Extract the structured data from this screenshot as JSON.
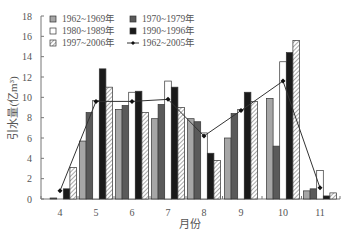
{
  "chart_data": {
    "type": "bar",
    "title": "",
    "xlabel": "月份",
    "ylabel": "引水量(亿m³)",
    "ylim": [
      0,
      18
    ],
    "yticks": [
      0,
      2,
      4,
      6,
      8,
      10,
      12,
      14,
      16,
      18
    ],
    "grid": false,
    "legend_position": "upper-left, inside, 2 columns",
    "categories": [
      "4",
      "5",
      "6",
      "7",
      "8",
      "9",
      "10",
      "11"
    ],
    "series": [
      {
        "name": "1962~1969年",
        "kind": "bar",
        "style": "light-gray",
        "color": "#a6a6a6",
        "values": [
          0.0,
          5.7,
          8.8,
          7.9,
          7.9,
          6.0,
          9.9,
          0.8
        ]
      },
      {
        "name": "1970~1979年",
        "kind": "bar",
        "style": "dark-gray",
        "color": "#5a5a5a",
        "values": [
          0.1,
          8.5,
          9.2,
          9.3,
          7.6,
          8.4,
          5.2,
          1.0
        ]
      },
      {
        "name": "1980~1989年",
        "kind": "bar",
        "style": "white",
        "color": "#ffffff",
        "values": [
          0.0,
          9.7,
          10.5,
          11.6,
          6.5,
          8.8,
          13.5,
          2.8
        ]
      },
      {
        "name": "1990~1996年",
        "kind": "bar",
        "style": "black",
        "color": "#1a1a1a",
        "values": [
          1.0,
          12.8,
          10.6,
          11.0,
          4.5,
          10.5,
          14.4,
          0.3
        ]
      },
      {
        "name": "1997~2006年",
        "kind": "bar",
        "style": "hatched",
        "color": "#ffffff",
        "values": [
          3.1,
          11.0,
          8.5,
          9.0,
          3.8,
          9.6,
          15.6,
          0.6
        ]
      },
      {
        "name": "1962~2005年",
        "kind": "line",
        "style": "line-with-markers",
        "color": "#333333",
        "values": [
          0.8,
          9.6,
          9.6,
          9.8,
          6.2,
          8.7,
          11.6,
          1.1
        ]
      }
    ]
  },
  "legend": {
    "items": [
      {
        "label": "1962~1969年"
      },
      {
        "label": "1970~1979年"
      },
      {
        "label": "1980~1989年"
      },
      {
        "label": "1990~1996年"
      },
      {
        "label": "1997~2006年"
      },
      {
        "label": "1962~2005年"
      }
    ]
  },
  "axes": {
    "xlabel": "月份",
    "ylabel": "引水量(亿m³)"
  }
}
